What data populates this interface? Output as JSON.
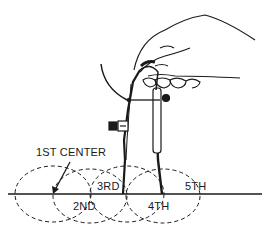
{
  "figure": {
    "labels": {
      "first_center": "1ST CENTER",
      "second": "2ND",
      "third": "3RD",
      "fourth": "4TH",
      "fifth": "5TH"
    },
    "colors": {
      "ink": "#1a1a1a",
      "background": "#ffffff"
    }
  }
}
